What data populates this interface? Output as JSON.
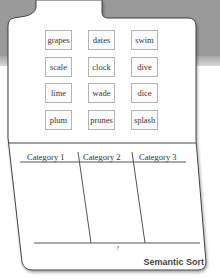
{
  "title": "Semantic Sort",
  "word_cards": [
    [
      "grapes",
      "dates",
      "swim"
    ],
    [
      "scale",
      "clock",
      "dive"
    ],
    [
      "lime",
      "wade",
      "dice"
    ],
    [
      "plum",
      "prunes",
      "splash"
    ]
  ],
  "categories": [
    "Category 1",
    "Category 2",
    "Category 3"
  ],
  "bottom_label": "?",
  "colors": {
    "background_top": "#9a9a9a",
    "folder_fill": "#ffffff",
    "folder_outline": "#444444",
    "card_border": "#b5b5b5"
  }
}
